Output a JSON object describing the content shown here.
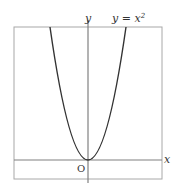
{
  "diagram": {
    "labels": {
      "y_axis": "y",
      "x_axis": "x",
      "origin": "O",
      "curve": "y = x",
      "curve_exponent": "2"
    },
    "colors": {
      "frame": "#a0a0a0",
      "axes": "#7a7a7a",
      "curve": "#333333",
      "background": "#ffffff"
    }
  }
}
